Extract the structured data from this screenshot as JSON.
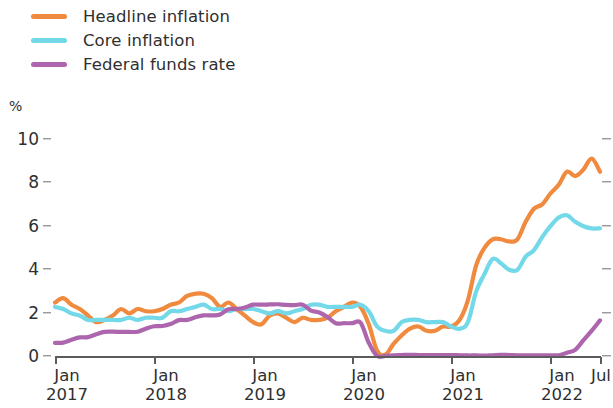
{
  "legend": {
    "position": "top-left",
    "items": [
      {
        "label": "Headline inflation",
        "color": "#F08A3E",
        "icon": "line-swatch"
      },
      {
        "label": "Core inflation",
        "color": "#73D8E8",
        "icon": "line-swatch"
      },
      {
        "label": "Federal funds rate",
        "color": "#AD66AE",
        "icon": "line-swatch"
      }
    ]
  },
  "axes": {
    "y_unit": "%",
    "y_ticks": [
      "0",
      "2",
      "4",
      "6",
      "8",
      "10"
    ],
    "x_ticks": [
      {
        "month": "Jan",
        "year": "2017"
      },
      {
        "month": "Jan",
        "year": "2018"
      },
      {
        "month": "Jan",
        "year": "2019"
      },
      {
        "month": "Jan",
        "year": "2020"
      },
      {
        "month": "Jan",
        "year": "2021"
      },
      {
        "month": "Jan",
        "year": "2022"
      },
      {
        "month": "Jul",
        "year": ""
      }
    ]
  },
  "chart_data": {
    "type": "line",
    "title": "",
    "subtitle": "",
    "xlabel": "",
    "ylabel": "%",
    "ylim": [
      0,
      10
    ],
    "yticks": [
      0,
      2,
      4,
      6,
      8,
      10
    ],
    "grid": false,
    "legend_position": "top-left",
    "x": [
      "2017-01",
      "2017-02",
      "2017-03",
      "2017-04",
      "2017-05",
      "2017-06",
      "2017-07",
      "2017-08",
      "2017-09",
      "2017-10",
      "2017-11",
      "2017-12",
      "2018-01",
      "2018-02",
      "2018-03",
      "2018-04",
      "2018-05",
      "2018-06",
      "2018-07",
      "2018-08",
      "2018-09",
      "2018-10",
      "2018-11",
      "2018-12",
      "2019-01",
      "2019-02",
      "2019-03",
      "2019-04",
      "2019-05",
      "2019-06",
      "2019-07",
      "2019-08",
      "2019-09",
      "2019-10",
      "2019-11",
      "2019-12",
      "2020-01",
      "2020-02",
      "2020-03",
      "2020-04",
      "2020-05",
      "2020-06",
      "2020-07",
      "2020-08",
      "2020-09",
      "2020-10",
      "2020-11",
      "2020-12",
      "2021-01",
      "2021-02",
      "2021-03",
      "2021-04",
      "2021-05",
      "2021-06",
      "2021-07",
      "2021-08",
      "2021-09",
      "2021-10",
      "2021-11",
      "2021-12",
      "2022-01",
      "2022-02",
      "2022-03",
      "2022-04",
      "2022-05",
      "2022-06",
      "2022-07"
    ],
    "series": [
      {
        "name": "Headline inflation",
        "color": "#F08A3E",
        "values": [
          2.5,
          2.7,
          2.4,
          2.2,
          1.9,
          1.6,
          1.7,
          1.9,
          2.2,
          2.0,
          2.2,
          2.1,
          2.1,
          2.2,
          2.4,
          2.5,
          2.8,
          2.9,
          2.9,
          2.7,
          2.3,
          2.5,
          2.2,
          1.9,
          1.6,
          1.5,
          1.9,
          2.0,
          1.8,
          1.6,
          1.8,
          1.7,
          1.7,
          1.8,
          2.1,
          2.3,
          2.5,
          2.3,
          1.5,
          0.3,
          0.1,
          0.6,
          1.0,
          1.3,
          1.4,
          1.2,
          1.2,
          1.4,
          1.4,
          1.7,
          2.6,
          4.2,
          5.0,
          5.4,
          5.4,
          5.3,
          5.4,
          6.2,
          6.8,
          7.0,
          7.5,
          7.9,
          8.5,
          8.3,
          8.6,
          9.1,
          8.5
        ]
      },
      {
        "name": "Core inflation",
        "color": "#73D8E8",
        "values": [
          2.3,
          2.2,
          2.0,
          1.9,
          1.7,
          1.7,
          1.7,
          1.7,
          1.7,
          1.8,
          1.7,
          1.8,
          1.8,
          1.8,
          2.1,
          2.1,
          2.2,
          2.3,
          2.4,
          2.2,
          2.2,
          2.1,
          2.2,
          2.2,
          2.2,
          2.1,
          2.0,
          2.1,
          2.0,
          2.1,
          2.2,
          2.4,
          2.4,
          2.3,
          2.3,
          2.3,
          2.3,
          2.4,
          2.1,
          1.4,
          1.2,
          1.2,
          1.6,
          1.7,
          1.7,
          1.6,
          1.6,
          1.6,
          1.4,
          1.3,
          1.6,
          3.0,
          3.8,
          4.5,
          4.3,
          4.0,
          4.0,
          4.6,
          4.9,
          5.5,
          6.0,
          6.4,
          6.5,
          6.2,
          6.0,
          5.9,
          5.9
        ]
      },
      {
        "name": "Federal funds rate",
        "color": "#AD66AE",
        "values": [
          0.65,
          0.66,
          0.79,
          0.9,
          0.91,
          1.04,
          1.15,
          1.16,
          1.15,
          1.15,
          1.16,
          1.3,
          1.41,
          1.42,
          1.51,
          1.69,
          1.7,
          1.82,
          1.91,
          1.91,
          1.95,
          2.19,
          2.2,
          2.27,
          2.4,
          2.4,
          2.41,
          2.42,
          2.39,
          2.38,
          2.4,
          2.13,
          2.04,
          1.83,
          1.55,
          1.55,
          1.55,
          1.58,
          0.65,
          0.05,
          0.05,
          0.08,
          0.09,
          0.1,
          0.09,
          0.09,
          0.09,
          0.09,
          0.09,
          0.08,
          0.07,
          0.07,
          0.06,
          0.08,
          0.1,
          0.09,
          0.08,
          0.08,
          0.08,
          0.08,
          0.08,
          0.08,
          0.2,
          0.33,
          0.77,
          1.21,
          1.68
        ]
      }
    ]
  }
}
